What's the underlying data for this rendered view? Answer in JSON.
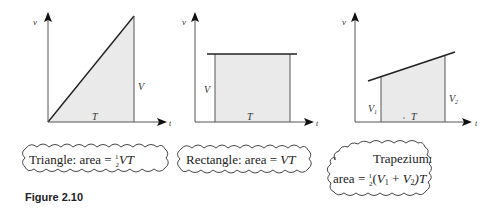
{
  "figure": {
    "label": "Figure 2.10"
  },
  "panels": [
    {
      "name": "triangle",
      "axis_y_label": "v",
      "axis_x_label": "t",
      "height_label": "V",
      "base_label": "T",
      "caption_prefix": "Triangle: area = ",
      "caption_fraction_num": "1",
      "caption_fraction_den": "2",
      "caption_suffix": "VT"
    },
    {
      "name": "rectangle",
      "axis_y_label": "v",
      "axis_x_label": "t",
      "height_label": "V",
      "base_label": "T",
      "caption_prefix": "Rectangle: area = ",
      "caption_suffix": "VT"
    },
    {
      "name": "trapezium",
      "axis_y_label": "v",
      "axis_x_label": "t",
      "left_height_label": "V",
      "left_height_sub": "1",
      "right_height_label": "V",
      "right_height_sub": "2",
      "base_label": "T",
      "caption_line1": "Trapezium:",
      "caption_line2_prefix": "area = ",
      "caption_fraction_num": "1",
      "caption_fraction_den": "2",
      "caption_line2_paren_open": "(",
      "caption_v1": "V",
      "caption_v1_sub": "1",
      "caption_plus": " + ",
      "caption_v2": "V",
      "caption_v2_sub": "2",
      "caption_line2_suffix": ")T"
    }
  ],
  "colors": {
    "fill": "#eaeaea",
    "line": "#222222",
    "thin_line": "#555555"
  }
}
